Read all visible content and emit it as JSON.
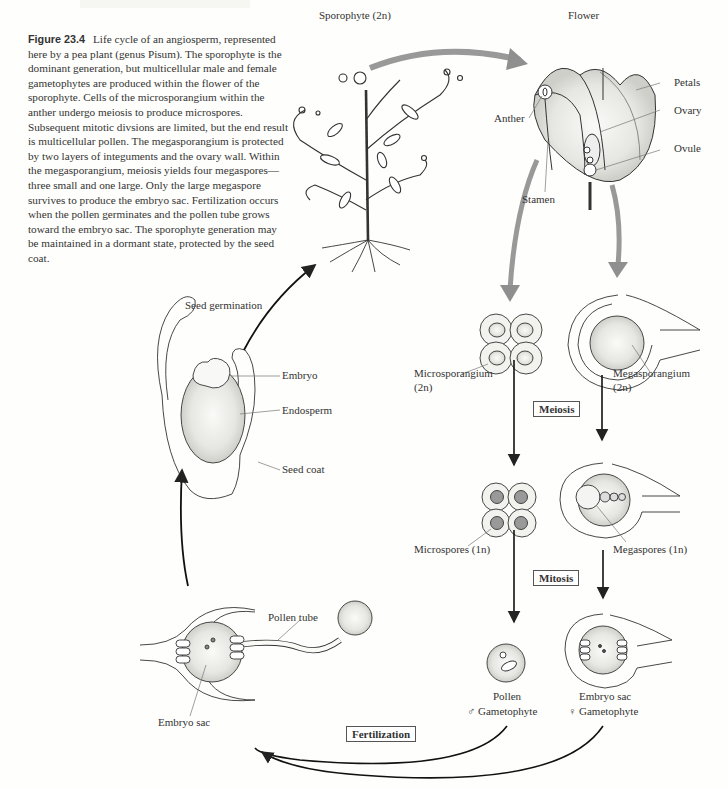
{
  "header": {
    "running_head": ""
  },
  "caption": {
    "figure_label": "Figure 23.4",
    "text": "Life cycle of an angiosperm, represented here by a pea plant (genus Pisum). The sporophyte is the dominant generation, but multicellular male and female gametophytes are produced within the flower of the sporophyte. Cells of the microsporangium within the anther undergo meiosis to produce microspores. Subsequent mitotic divsions are limited, but the end result is multicellular pollen. The megasporangium is protected by two layers of integuments and the ovary wall. Within the megasporangium, meiosis yields four megaspores—three small and one large. Only the large megaspore survives to produce the embryo sac. Fertilization occurs when the pollen germinates and the pollen tube grows toward the embryo sac. The sporophyte generation may be maintained in a dormant state, protected by the seed coat.",
    "genus": "Pisum"
  },
  "labels": {
    "sporophyte": "Sporophyte (2n)",
    "flower": "Flower",
    "petals": "Petals",
    "ovary": "Ovary",
    "ovule": "Ovule",
    "anther": "Anther",
    "stamen": "Stamen",
    "seed_germination": "Seed germination",
    "embryo": "Embryo",
    "endosperm": "Endosperm",
    "seed_coat": "Seed coat",
    "microsporangium": "Microsporangium",
    "microsporangium_ploidy": "(2n)",
    "megasporangium": "Megasporangium",
    "megasporangium_ploidy": "(2n)",
    "microspores": "Microspores (1n)",
    "megaspores": "Megaspores (1n)",
    "pollen_tube": "Pollen tube",
    "embryo_sac_left": "Embryo sac",
    "pollen": "Pollen",
    "male_gametophyte": "♂ Gametophyte",
    "embryo_sac_right": "Embryo sac",
    "female_gametophyte": "♀ Gametophyte"
  },
  "stages": {
    "meiosis": "Meiosis",
    "mitosis": "Mitosis",
    "fertilization": "Fertilization"
  },
  "colors": {
    "ink": "#222222",
    "gray_arrow": "#8f8f8f",
    "stipple": "#d6d6d2",
    "paper": "#fefefc"
  }
}
